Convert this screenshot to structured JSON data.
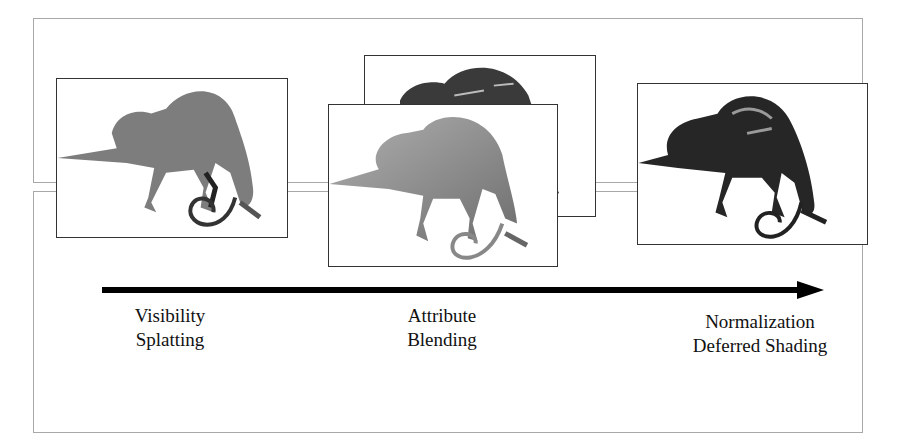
{
  "figure": {
    "stages": [
      {
        "id": "visibility-splatting",
        "line1": "Visibility",
        "line2": "Splatting",
        "image": "flat-shaded-chameleon"
      },
      {
        "id": "attribute-blending",
        "line1": "Attribute",
        "line2": "Blending",
        "image": "stacked-attribute-chameleons"
      },
      {
        "id": "normalization-deferred-shading",
        "line1": "Normalization",
        "line2": "Deferred Shading",
        "image": "shaded-chameleon"
      }
    ],
    "arrow": "pipeline-direction-arrow"
  }
}
